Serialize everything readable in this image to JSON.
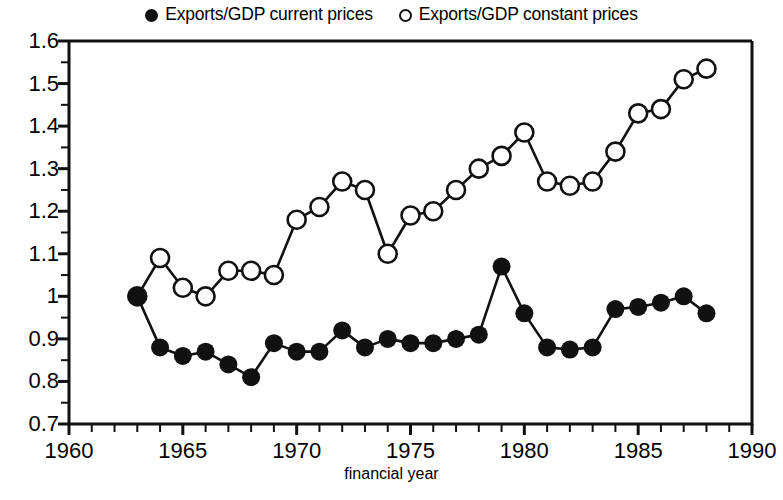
{
  "chart_data": {
    "type": "line",
    "title": "",
    "xlabel": "financial year",
    "ylabel": "",
    "xlim": [
      1960,
      1990
    ],
    "ylim": [
      0.7,
      1.6
    ],
    "grid": false,
    "legend_position": "top-center",
    "x_ticks_major": [
      1960,
      1965,
      1970,
      1975,
      1980,
      1985,
      1990
    ],
    "x_ticks_minor_step": 1,
    "y_ticks_major": [
      "0.7",
      "0.8",
      "0.9",
      "1",
      "1.1",
      "1.2",
      "1.3",
      "1.4",
      "1.5",
      "1.6"
    ],
    "y_ticks_minor_step": 0.05,
    "x": [
      1963,
      1964,
      1965,
      1966,
      1967,
      1968,
      1969,
      1970,
      1971,
      1972,
      1973,
      1974,
      1975,
      1976,
      1977,
      1978,
      1979,
      1980,
      1981,
      1982,
      1983,
      1984,
      1985,
      1986,
      1987,
      1988
    ],
    "series": [
      {
        "name": "Exports/GDP current prices",
        "marker": "filled-circle",
        "color": "#111111",
        "values": [
          1.0,
          0.88,
          0.86,
          0.87,
          0.84,
          0.81,
          0.89,
          0.87,
          0.87,
          0.92,
          0.88,
          0.9,
          0.89,
          0.89,
          0.9,
          0.91,
          1.07,
          0.96,
          0.88,
          0.875,
          0.88,
          0.97,
          0.975,
          0.985,
          1.0,
          0.96
        ]
      },
      {
        "name": "Exports/GDP constant prices",
        "marker": "open-circle",
        "color": "#111111",
        "values": [
          1.0,
          1.09,
          1.02,
          1.0,
          1.06,
          1.06,
          1.05,
          1.18,
          1.21,
          1.27,
          1.25,
          1.1,
          1.19,
          1.2,
          1.25,
          1.3,
          1.33,
          1.385,
          1.27,
          1.26,
          1.27,
          1.34,
          1.43,
          1.44,
          1.51,
          1.535
        ]
      }
    ]
  },
  "legend": {
    "entries": [
      {
        "label": "Exports/GDP current prices",
        "marker": "filled-circle"
      },
      {
        "label": "Exports/GDP constant prices",
        "marker": "open-circle"
      }
    ]
  },
  "axes": {
    "x_label": "financial year",
    "x_tick_labels": [
      "1960",
      "1965",
      "1970",
      "1975",
      "1980",
      "1985",
      "1990"
    ],
    "y_tick_labels": [
      "1.6",
      "1.5",
      "1.4",
      "1.3",
      "1.2",
      "1.1",
      "1",
      "0.9",
      "0.8",
      "0.7"
    ]
  }
}
